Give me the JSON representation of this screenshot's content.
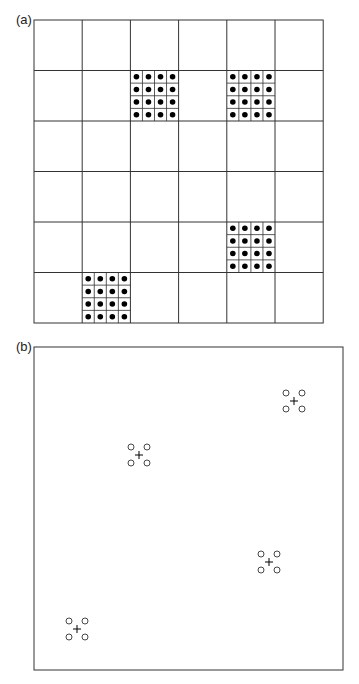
{
  "panels": [
    {
      "label": "(a)",
      "type": "grid",
      "rows": 6,
      "cols": 6,
      "origin": [
        34,
        20
      ],
      "cell_w": 48.2,
      "cell_h": 50.5,
      "filled_cells": [
        {
          "row": 1,
          "col": 2,
          "subgrid": 4
        },
        {
          "row": 1,
          "col": 4,
          "subgrid": 4
        },
        {
          "row": 4,
          "col": 4,
          "subgrid": 4
        },
        {
          "row": 5,
          "col": 1,
          "subgrid": 4
        }
      ]
    },
    {
      "label": "(b)",
      "type": "scatter",
      "box": [
        34,
        347,
        343,
        670
      ],
      "clusters": [
        {
          "cx": 139,
          "cy": 455
        },
        {
          "cx": 294,
          "cy": 401
        },
        {
          "cx": 269,
          "cy": 562
        },
        {
          "cx": 77,
          "cy": 629
        }
      ],
      "circle_offset": 8,
      "circle_r": 3
    }
  ],
  "colors": {
    "line": "#333333",
    "dot": "#000000",
    "background": "#ffffff"
  }
}
